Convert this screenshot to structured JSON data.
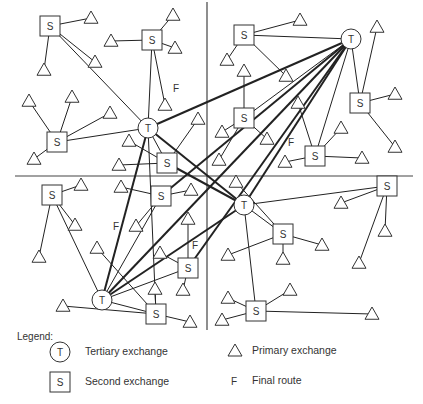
{
  "diagram": {
    "dividers": [
      {
        "x1": 207,
        "y1": 2,
        "x2": 207,
        "y2": 330
      },
      {
        "x1": 15,
        "y1": 176,
        "x2": 413,
        "y2": 176
      }
    ],
    "nodes": [
      {
        "id": "T1",
        "type": "tertiary",
        "label": "T",
        "x": 148,
        "y": 128
      },
      {
        "id": "T2",
        "type": "tertiary",
        "label": "T",
        "x": 351,
        "y": 39
      },
      {
        "id": "T3",
        "type": "tertiary",
        "label": "T",
        "x": 102,
        "y": 300
      },
      {
        "id": "T4",
        "type": "tertiary",
        "label": "T",
        "x": 244,
        "y": 205
      },
      {
        "id": "S1",
        "type": "second",
        "label": "S",
        "x": 50,
        "y": 26
      },
      {
        "id": "S2",
        "type": "second",
        "label": "S",
        "x": 152,
        "y": 40
      },
      {
        "id": "S3",
        "type": "second",
        "label": "S",
        "x": 57,
        "y": 142
      },
      {
        "id": "S4",
        "type": "second",
        "label": "S",
        "x": 167,
        "y": 163
      },
      {
        "id": "S5",
        "type": "second",
        "label": "S",
        "x": 244,
        "y": 35
      },
      {
        "id": "S6",
        "type": "second",
        "label": "S",
        "x": 360,
        "y": 103
      },
      {
        "id": "S7",
        "type": "second",
        "label": "S",
        "x": 315,
        "y": 156
      },
      {
        "id": "S8",
        "type": "second",
        "label": "S",
        "x": 244,
        "y": 118
      },
      {
        "id": "S9",
        "type": "second",
        "label": "S",
        "x": 52,
        "y": 195
      },
      {
        "id": "S10",
        "type": "second",
        "label": "S",
        "x": 161,
        "y": 196
      },
      {
        "id": "S11",
        "type": "second",
        "label": "S",
        "x": 188,
        "y": 268
      },
      {
        "id": "S12",
        "type": "second",
        "label": "S",
        "x": 156,
        "y": 314
      },
      {
        "id": "S13",
        "type": "second",
        "label": "S",
        "x": 283,
        "y": 234
      },
      {
        "id": "S14",
        "type": "second",
        "label": "S",
        "x": 387,
        "y": 186
      },
      {
        "id": "S15",
        "type": "second",
        "label": "S",
        "x": 256,
        "y": 311
      }
    ],
    "primaries": [
      {
        "id": "P1",
        "x": 91,
        "y": 18,
        "to": "S1"
      },
      {
        "id": "P2",
        "x": 95,
        "y": 62,
        "to": "S1"
      },
      {
        "id": "P3",
        "x": 44,
        "y": 70,
        "to": "S1"
      },
      {
        "id": "P4",
        "x": 173,
        "y": 15,
        "to": "S2"
      },
      {
        "id": "P5",
        "x": 111,
        "y": 41,
        "to": "S2"
      },
      {
        "id": "P6",
        "x": 175,
        "y": 48,
        "to": "S2"
      },
      {
        "id": "P7",
        "x": 165,
        "y": 105,
        "to": "S2"
      },
      {
        "id": "P8",
        "x": 29,
        "y": 101,
        "to": "S3"
      },
      {
        "id": "P9",
        "x": 72,
        "y": 97,
        "to": "S3"
      },
      {
        "id": "P10",
        "x": 110,
        "y": 113,
        "to": "S3"
      },
      {
        "id": "P11",
        "x": 34,
        "y": 159,
        "to": "S3"
      },
      {
        "id": "P12",
        "x": 129,
        "y": 141,
        "to": "S4"
      },
      {
        "id": "P13",
        "x": 119,
        "y": 165,
        "to": "S4"
      },
      {
        "id": "P14",
        "x": 198,
        "y": 119,
        "to": "S4"
      },
      {
        "id": "P15",
        "x": 300,
        "y": 20,
        "to": "S5"
      },
      {
        "id": "P16",
        "x": 227,
        "y": 60,
        "to": "S5"
      },
      {
        "id": "P17",
        "x": 286,
        "y": 76,
        "to": "S5"
      },
      {
        "id": "P18",
        "x": 244,
        "y": 71,
        "to": "S8"
      },
      {
        "id": "P19",
        "x": 377,
        "y": 27,
        "to": "S6"
      },
      {
        "id": "P20",
        "x": 395,
        "y": 94,
        "to": "S6"
      },
      {
        "id": "P21",
        "x": 395,
        "y": 147,
        "to": "S6"
      },
      {
        "id": "P22",
        "x": 341,
        "y": 128,
        "to": "S7"
      },
      {
        "id": "P23",
        "x": 362,
        "y": 158,
        "to": "S7"
      },
      {
        "id": "P24",
        "x": 298,
        "y": 103,
        "to": "S7"
      },
      {
        "id": "P25",
        "x": 285,
        "y": 162,
        "to": "S7"
      },
      {
        "id": "P26",
        "x": 222,
        "y": 132,
        "to": "S8"
      },
      {
        "id": "P27",
        "x": 267,
        "y": 139,
        "to": "S8"
      },
      {
        "id": "P28",
        "x": 219,
        "y": 160,
        "to": "S8"
      },
      {
        "id": "P29",
        "x": 81,
        "y": 185,
        "to": "S9"
      },
      {
        "id": "P30",
        "x": 75,
        "y": 225,
        "to": "S9"
      },
      {
        "id": "P31",
        "x": 39,
        "y": 257,
        "to": "S9"
      },
      {
        "id": "P32",
        "x": 121,
        "y": 187,
        "to": "S10"
      },
      {
        "id": "P33",
        "x": 191,
        "y": 190,
        "to": "S10"
      },
      {
        "id": "P34",
        "x": 136,
        "y": 226,
        "to": "S10"
      },
      {
        "id": "P35",
        "x": 188,
        "y": 219,
        "to": "S11"
      },
      {
        "id": "P36",
        "x": 160,
        "y": 253,
        "to": "S11"
      },
      {
        "id": "P37",
        "x": 183,
        "y": 290,
        "to": "S11"
      },
      {
        "id": "P38",
        "x": 97,
        "y": 248,
        "to": "S12"
      },
      {
        "id": "P39",
        "x": 63,
        "y": 306,
        "to": "S12"
      },
      {
        "id": "P40",
        "x": 155,
        "y": 289,
        "to": "S12"
      },
      {
        "id": "P41",
        "x": 190,
        "y": 322,
        "to": "S12"
      },
      {
        "id": "P42",
        "x": 236,
        "y": 182,
        "to": "S13"
      },
      {
        "id": "P43",
        "x": 228,
        "y": 255,
        "to": "S13"
      },
      {
        "id": "P44",
        "x": 283,
        "y": 259,
        "to": "S13"
      },
      {
        "id": "P45",
        "x": 322,
        "y": 245,
        "to": "S13"
      },
      {
        "id": "P46",
        "x": 341,
        "y": 203,
        "to": "S14"
      },
      {
        "id": "P47",
        "x": 385,
        "y": 231,
        "to": "S14"
      },
      {
        "id": "P48",
        "x": 359,
        "y": 263,
        "to": "S14"
      },
      {
        "id": "P49",
        "x": 228,
        "y": 298,
        "to": "S15"
      },
      {
        "id": "P50",
        "x": 290,
        "y": 290,
        "to": "S15"
      },
      {
        "id": "P51",
        "x": 222,
        "y": 320,
        "to": "S15"
      },
      {
        "id": "P52",
        "x": 372,
        "y": 314,
        "to": "S15"
      }
    ],
    "links": [
      {
        "from": "S1",
        "to": "T1",
        "heavy": false
      },
      {
        "from": "S2",
        "to": "T1",
        "heavy": false
      },
      {
        "from": "S3",
        "to": "T1",
        "heavy": false
      },
      {
        "from": "S4",
        "to": "T1",
        "heavy": false
      },
      {
        "from": "S5",
        "to": "T2",
        "heavy": false
      },
      {
        "from": "S6",
        "to": "T2",
        "heavy": false
      },
      {
        "from": "S7",
        "to": "T2",
        "heavy": false
      },
      {
        "from": "S8",
        "to": "T2",
        "heavy": false
      },
      {
        "from": "S9",
        "to": "T3",
        "heavy": false
      },
      {
        "from": "S10",
        "to": "T3",
        "heavy": false
      },
      {
        "from": "S11",
        "to": "T3",
        "heavy": false
      },
      {
        "from": "S12",
        "to": "T3",
        "heavy": false
      },
      {
        "from": "S13",
        "to": "T4",
        "heavy": false
      },
      {
        "from": "S14",
        "to": "T4",
        "heavy": false
      },
      {
        "from": "S15",
        "to": "T4",
        "heavy": false
      },
      {
        "from": "T1",
        "to": "S12",
        "heavy": false
      },
      {
        "from": "T1",
        "to": "T2",
        "heavy": true
      },
      {
        "from": "T1",
        "to": "T3",
        "heavy": true
      },
      {
        "from": "T1",
        "to": "T4",
        "heavy": true
      },
      {
        "from": "T2",
        "to": "T3",
        "heavy": true
      },
      {
        "from": "T2",
        "to": "T4",
        "heavy": true
      },
      {
        "from": "T3",
        "to": "T4",
        "heavy": true
      },
      {
        "from": "T2",
        "to": "S10",
        "heavy": true
      },
      {
        "from": "T2",
        "to": "S11",
        "heavy": true
      },
      {
        "from": "T4",
        "to": "S4",
        "heavy": true
      }
    ],
    "final_route_labels": [
      {
        "text": "F",
        "x": 176,
        "y": 92
      },
      {
        "text": "F",
        "x": 291,
        "y": 146
      },
      {
        "text": "F",
        "x": 116,
        "y": 230
      },
      {
        "text": "F",
        "x": 195,
        "y": 249
      }
    ]
  },
  "legend": {
    "title": "Legend:",
    "items": [
      {
        "symbol": "T",
        "shape": "circle",
        "label": "Tertiary exchange"
      },
      {
        "symbol": "S",
        "shape": "square",
        "label": "Second exchange"
      },
      {
        "symbol": "",
        "shape": "triangle",
        "label": "Primary exchange"
      },
      {
        "symbol": "F",
        "shape": "letter",
        "label": "Final route"
      }
    ]
  }
}
